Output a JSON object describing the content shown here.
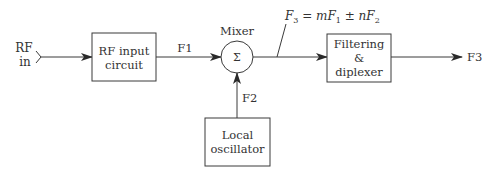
{
  "diagram": {
    "colors": {
      "stroke": "#3a3a3a",
      "text": "#333333",
      "background": "#ffffff"
    },
    "input": {
      "label_line1": "RF",
      "label_line2": "in"
    },
    "blocks": {
      "rf_input": {
        "line1": "RF input",
        "line2": "circuit"
      },
      "mixer": {
        "label": "Mixer",
        "symbol": "Σ"
      },
      "filter": {
        "line1": "Filtering",
        "line2": "&",
        "line3": "diplexer"
      },
      "local_osc": {
        "line1": "Local",
        "line2": "oscillator"
      }
    },
    "signals": {
      "f1": "F1",
      "f2": "F2",
      "f3_out": "F3"
    },
    "formula": {
      "lhs": "F",
      "lhs_sub": "3",
      "eq": " = ",
      "m": "m",
      "f1": "F",
      "f1_sub": "1",
      "pm": " ± ",
      "n": "n",
      "f2": "F",
      "f2_sub": "2"
    }
  }
}
